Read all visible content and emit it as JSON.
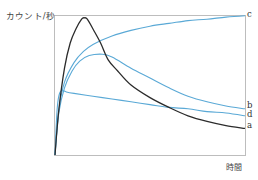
{
  "chart_data": {
    "type": "line",
    "title": "",
    "xlabel": "時間",
    "ylabel": "カウント/秒",
    "grid": false,
    "ticks": {
      "x": [],
      "y": []
    },
    "legend": "inline labels at right end of each curve",
    "x_domain": [
      0,
      1
    ],
    "y_domain": [
      0,
      1
    ],
    "series": [
      {
        "name": "a",
        "color": "#2b2b2b",
        "description": "sharp rise to early high peak, then decay to lowest end value",
        "points": [
          [
            0,
            0
          ],
          [
            0.02,
            0.32
          ],
          [
            0.05,
            0.62
          ],
          [
            0.08,
            0.8
          ],
          [
            0.11,
            0.9
          ],
          [
            0.14,
            0.97
          ],
          [
            0.155,
            0.98
          ],
          [
            0.17,
            0.97
          ],
          [
            0.2,
            0.9
          ],
          [
            0.24,
            0.8
          ],
          [
            0.28,
            0.68
          ],
          [
            0.33,
            0.6
          ],
          [
            0.4,
            0.5
          ],
          [
            0.5,
            0.41
          ],
          [
            0.6,
            0.34
          ],
          [
            0.7,
            0.28
          ],
          [
            0.8,
            0.24
          ],
          [
            0.9,
            0.21
          ],
          [
            1.0,
            0.19
          ]
        ]
      },
      {
        "name": "b",
        "color": "#5aa9d6",
        "description": "rise to broad peak, then gradual decline",
        "points": [
          [
            0,
            0
          ],
          [
            0.02,
            0.3
          ],
          [
            0.05,
            0.48
          ],
          [
            0.09,
            0.6
          ],
          [
            0.13,
            0.67
          ],
          [
            0.18,
            0.71
          ],
          [
            0.25,
            0.72
          ],
          [
            0.3,
            0.7
          ],
          [
            0.4,
            0.62
          ],
          [
            0.5,
            0.55
          ],
          [
            0.6,
            0.48
          ],
          [
            0.7,
            0.42
          ],
          [
            0.8,
            0.38
          ],
          [
            0.9,
            0.35
          ],
          [
            1.0,
            0.33
          ]
        ]
      },
      {
        "name": "c",
        "color": "#5aa9d6",
        "description": "rapid rise then slow approach to a plateau at top",
        "points": [
          [
            0,
            0
          ],
          [
            0.02,
            0.32
          ],
          [
            0.05,
            0.52
          ],
          [
            0.1,
            0.66
          ],
          [
            0.15,
            0.74
          ],
          [
            0.2,
            0.79
          ],
          [
            0.3,
            0.85
          ],
          [
            0.4,
            0.89
          ],
          [
            0.5,
            0.92
          ],
          [
            0.6,
            0.94
          ],
          [
            0.7,
            0.96
          ],
          [
            0.8,
            0.97
          ],
          [
            0.9,
            0.985
          ],
          [
            1.0,
            0.995
          ]
        ]
      },
      {
        "name": "d",
        "color": "#5aa9d6",
        "description": "almost instant jump, then slow steady decline",
        "points": [
          [
            0,
            0
          ],
          [
            0.01,
            0.3
          ],
          [
            0.02,
            0.42
          ],
          [
            0.035,
            0.46
          ],
          [
            0.06,
            0.45
          ],
          [
            0.1,
            0.44
          ],
          [
            0.2,
            0.42
          ],
          [
            0.3,
            0.4
          ],
          [
            0.4,
            0.38
          ],
          [
            0.5,
            0.36
          ],
          [
            0.6,
            0.34
          ],
          [
            0.7,
            0.33
          ],
          [
            0.8,
            0.31
          ],
          [
            0.9,
            0.3
          ],
          [
            1.0,
            0.28
          ]
        ]
      }
    ],
    "end_labels": [
      "c",
      "b",
      "d",
      "a"
    ]
  },
  "axes": {
    "y_title": "カウント/秒",
    "x_title": "時間"
  },
  "labels": {
    "a": "a",
    "b": "b",
    "c": "c",
    "d": "d"
  },
  "colors": {
    "frame": "#bdbdbd",
    "black_curve": "#2b2b2b",
    "blue_curve": "#5aa9d6"
  }
}
